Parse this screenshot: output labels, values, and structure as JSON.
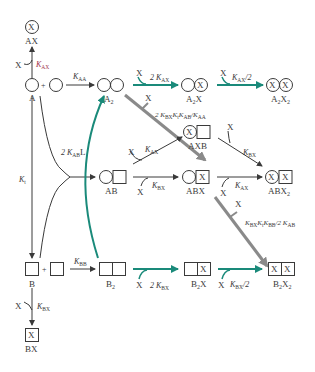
{
  "colors": {
    "line": "#3a3a3a",
    "teal": "#1a8a7a",
    "gray_arrow": "#8a8a8a",
    "red_label": "#a0334a"
  },
  "species": {
    "AX": "AX",
    "A": "A",
    "A2": "A2",
    "A2X": "A2X",
    "A2X2": "A2X2",
    "AXB": "AXB",
    "AB": "AB",
    "ABX": "ABX",
    "ABX2": "ABX2",
    "B": "B",
    "B2": "B2",
    "B2X": "B2X",
    "B2X2": "B2X2",
    "BX": "BX"
  },
  "ligand": {
    "X": "X",
    "L": "L",
    "plus": "+"
  },
  "rate_labels": {
    "K_AX": "K_AX",
    "K_AA": "K_AA",
    "2K_AX": "2 K_AX",
    "K_AX_half": "K_AX/2",
    "2K_BX_Kt_KAB_over_KAA": "2 K_BX K_t K_AB / K_AA",
    "2K_AB": "2 K_AB",
    "K_t": "K_t",
    "K_BX": "K_BX",
    "K_BB": "K_BB",
    "2K_BX": "2 K_BX",
    "K_BX_half": "K_BX/2",
    "KBX_Kt_KBB_over_2KAB": "K_BX K_t K_BB / 2 K_AB"
  },
  "glyphs": {
    "x_in_shape": "X"
  }
}
